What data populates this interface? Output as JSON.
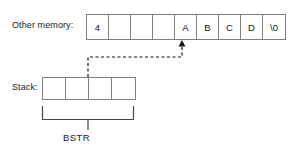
{
  "diagram": {
    "title_labels": {
      "other_memory": "Other memory:",
      "stack": "Stack:",
      "bstr": "BSTR"
    },
    "memory_row": {
      "name": "other-memory-cells",
      "cells": [
        {
          "value": "4",
          "kind": "length-prefix"
        },
        {
          "value": "",
          "kind": "empty"
        },
        {
          "value": "",
          "kind": "empty"
        },
        {
          "value": "",
          "kind": "empty"
        },
        {
          "value": "A",
          "kind": "char"
        },
        {
          "value": "B",
          "kind": "char"
        },
        {
          "value": "C",
          "kind": "char"
        },
        {
          "value": "D",
          "kind": "char"
        },
        {
          "value": "\\0",
          "kind": "terminator"
        }
      ]
    },
    "stack_row": {
      "name": "stack-cells",
      "cells": [
        {
          "value": ""
        },
        {
          "value": ""
        },
        {
          "value": ""
        },
        {
          "value": ""
        }
      ]
    },
    "connector": {
      "style": "dashed",
      "from": "stack-cell-3",
      "to": "memory-cell-A",
      "arrowhead": "up"
    },
    "bracket": {
      "spans": "stack-row",
      "label": "BSTR"
    },
    "colors": {
      "line": "#7d7d7d",
      "connector": "#111111",
      "text": "#1a1a1a",
      "background": "#ffffff"
    }
  }
}
